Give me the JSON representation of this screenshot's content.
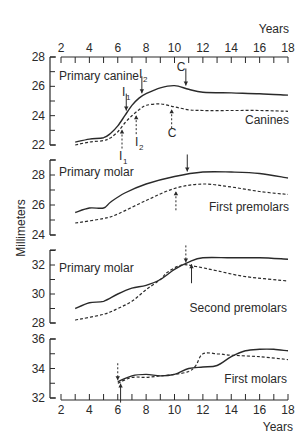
{
  "chart_data": {
    "type": "line",
    "title": "",
    "xlabel": "Years",
    "ylabel": "Millimeters",
    "x_ticks": [
      2,
      4,
      6,
      8,
      10,
      12,
      14,
      16,
      18
    ],
    "xlim": [
      2,
      18
    ],
    "grid": false,
    "legend": "none (panel labels inline)",
    "panels": [
      {
        "name": "Canines",
        "label_right": "Canines",
        "label_left": "Primary canine",
        "ylim": [
          22,
          28
        ],
        "y_ticks": [
          22,
          24,
          26,
          28
        ],
        "series": [
          {
            "name": "Primary canine (solid)",
            "style": "solid",
            "x": [
              3,
              4,
              5,
              5.5,
              6,
              6.5,
              7,
              7.5,
              8,
              9,
              10,
              11,
              12,
              14,
              16,
              18
            ],
            "y": [
              22.2,
              22.4,
              22.5,
              22.8,
              23.3,
              24,
              24.7,
              25.2,
              25.5,
              25.9,
              26.05,
              25.8,
              25.6,
              25.55,
              25.5,
              25.4
            ]
          },
          {
            "name": "Canines (dashed)",
            "style": "dashed",
            "x": [
              3,
              4,
              5,
              5.5,
              6,
              6.5,
              7,
              7.5,
              8,
              9,
              10,
              11,
              12,
              14,
              16,
              18
            ],
            "y": [
              22,
              22.2,
              22.3,
              22.5,
              22.9,
              23.5,
              24,
              24.4,
              24.7,
              24.8,
              24.6,
              24.4,
              24.35,
              24.35,
              24.35,
              24.3
            ]
          }
        ],
        "annotations": [
          {
            "text": "I1",
            "x": 6.6,
            "arrow": "down",
            "line": "solid"
          },
          {
            "text": "I2",
            "x": 7.7,
            "arrow": "down",
            "line": "solid"
          },
          {
            "text": "C",
            "x": 10.8,
            "arrow": "down",
            "line": "solid"
          },
          {
            "text": "I1",
            "x": 6.3,
            "arrow": "up",
            "line": "dashed"
          },
          {
            "text": "I2",
            "x": 7.3,
            "arrow": "up",
            "line": "dashed"
          },
          {
            "text": "C",
            "x": 9.8,
            "arrow": "up",
            "line": "dashed"
          }
        ]
      },
      {
        "name": "First premolars",
        "label_right": "First premolars",
        "label_left": "Primary molar",
        "ylim": [
          24,
          29
        ],
        "y_ticks": [
          24,
          26,
          28
        ],
        "series": [
          {
            "name": "Primary molar (solid)",
            "style": "solid",
            "x": [
              3,
              4,
              5,
              5.5,
              6.5,
              8,
              10,
              12,
              14,
              16,
              18
            ],
            "y": [
              25.5,
              25.8,
              25.8,
              26.2,
              26.8,
              27.4,
              27.9,
              28.2,
              28.2,
              28.1,
              27.8
            ]
          },
          {
            "name": "First premolars (dashed)",
            "style": "dashed",
            "x": [
              3,
              5,
              6,
              8,
              10,
              12,
              14,
              16,
              18
            ],
            "y": [
              24.8,
              25.1,
              25.4,
              26.3,
              27.1,
              27.4,
              27.2,
              26.9,
              26.7
            ]
          }
        ],
        "annotations": [
          {
            "text": "",
            "x": 10.9,
            "arrow": "down",
            "line": "solid"
          },
          {
            "text": "",
            "x": 10.1,
            "arrow": "up",
            "line": "dashed"
          }
        ]
      },
      {
        "name": "Second premolars",
        "label_right": "Second premolars",
        "label_left": "Primary molar",
        "ylim": [
          28,
          33
        ],
        "y_ticks": [
          28,
          30,
          32
        ],
        "series": [
          {
            "name": "Primary molar (solid)",
            "style": "solid",
            "x": [
              3,
              4,
              5,
              6,
              7,
              8,
              9,
              10,
              11,
              12,
              14,
              16,
              18
            ],
            "y": [
              29,
              29.4,
              29.5,
              30,
              30.4,
              30.6,
              31,
              31.7,
              32.2,
              32.5,
              32.5,
              32.5,
              32.4
            ]
          },
          {
            "name": "Second premolars (dashed)",
            "style": "dashed",
            "x": [
              3,
              5,
              6,
              7,
              8,
              9,
              9.5,
              10.5,
              11.5,
              13,
              15,
              18
            ],
            "y": [
              28.2,
              28.6,
              29,
              29.5,
              30.3,
              31,
              31.5,
              32,
              31.9,
              31.6,
              31.2,
              30.9
            ]
          }
        ],
        "annotations": [
          {
            "text": "",
            "x": 10.8,
            "arrow": "down",
            "line": "dashed"
          },
          {
            "text": "",
            "x": 11.2,
            "arrow": "up",
            "line": "solid"
          }
        ]
      },
      {
        "name": "First molars",
        "label_right": "First molars",
        "label_left": "",
        "ylim": [
          32,
          36
        ],
        "y_ticks": [
          32,
          34,
          36
        ],
        "series": [
          {
            "name": "First molars (solid)",
            "style": "solid",
            "x": [
              6,
              7,
              8,
              9,
              10,
              11,
              12,
              13,
              14,
              15,
              16,
              17,
              18
            ],
            "y": [
              33.1,
              33.5,
              33.6,
              33.5,
              33.6,
              34,
              34.1,
              34.2,
              34.8,
              35.2,
              35.3,
              35.3,
              35.2
            ]
          },
          {
            "name": "First molars (dashed)",
            "style": "dashed",
            "x": [
              6,
              7,
              8,
              9,
              10,
              11,
              11.5,
              12,
              13,
              14,
              16,
              18
            ],
            "y": [
              33,
              33.4,
              33.4,
              33.5,
              33.6,
              33.8,
              34.2,
              35,
              35,
              34.9,
              34.8,
              34.6
            ]
          }
        ],
        "annotations": [
          {
            "text": "",
            "x": 6.0,
            "arrow": "down",
            "line": "dashed"
          },
          {
            "text": "",
            "x": 6.2,
            "arrow": "up",
            "line": "solid"
          }
        ]
      }
    ]
  },
  "labels": {
    "years_top": "Years",
    "years_bottom": "Years",
    "ylabel": "Millimeters",
    "panel1_left": "Primary canine",
    "panel1_right": "Canines",
    "panel2_left": "Primary molar",
    "panel2_right": "First premolars",
    "panel3_left": "Primary molar",
    "panel3_right": "Second premolars",
    "panel4_right": "First molars",
    "i1": "I",
    "i2": "I",
    "sub1": "1",
    "sub2": "2",
    "c": "C"
  },
  "style": {
    "line_color": "#2a2a2a",
    "background": "#ffffff"
  }
}
